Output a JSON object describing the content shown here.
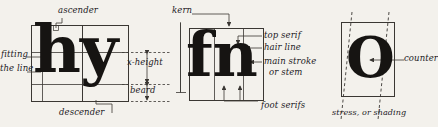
{
  "figure": {
    "background_color": "#f3f1ec",
    "ink_color": "#161412",
    "rule_color": "#3a3733"
  },
  "panels": [
    {
      "id": "panel-hy",
      "name": "hy-panel",
      "specimen": "hy",
      "labels": [
        {
          "id": "ascender",
          "text": "ascender"
        },
        {
          "id": "fitting-line-1",
          "text": "fitting"
        },
        {
          "id": "fitting-line-2",
          "text": "the line"
        },
        {
          "id": "x-height",
          "text": "x-height"
        },
        {
          "id": "beard",
          "text": "beard"
        },
        {
          "id": "descender",
          "text": "descender"
        }
      ]
    },
    {
      "id": "panel-fn",
      "name": "fn-panel",
      "specimen": "fn",
      "labels": [
        {
          "id": "kern",
          "text": "kern"
        },
        {
          "id": "top-serif",
          "text": "top serif"
        },
        {
          "id": "hair-line",
          "text": "hair line"
        },
        {
          "id": "main-stroke",
          "text": "main stroke"
        },
        {
          "id": "or-stem",
          "text": "or stem"
        },
        {
          "id": "foot-serifs",
          "text": "foot serifs"
        }
      ]
    },
    {
      "id": "panel-o",
      "name": "o-panel",
      "specimen": "O",
      "labels": [
        {
          "id": "counter",
          "text": "counter"
        },
        {
          "id": "stress-or-shading",
          "text": "stress, or shading"
        }
      ]
    }
  ]
}
